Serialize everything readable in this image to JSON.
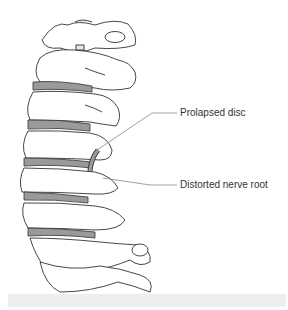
{
  "figure": {
    "labels": [
      {
        "id": "prolapsed-disc",
        "text": "Prolapsed disc"
      },
      {
        "id": "distorted-nerve-root",
        "text": "Distorted nerve root"
      }
    ]
  },
  "colors": {
    "bone_fill": "#ffffff",
    "bone_shade": "#e6e6e6",
    "outline": "#333333",
    "disc": "#9a9a9a",
    "leader": "#888888",
    "footer": "#eeeeee"
  }
}
